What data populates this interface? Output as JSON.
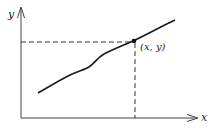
{
  "diagram": {
    "type": "function-graph",
    "axes": {
      "x_label": "x",
      "y_label": "y"
    },
    "point": {
      "label": "(x, y)"
    },
    "colors": {
      "stroke": "#1a1a1a",
      "guide": "#333333",
      "background": "#ffffff"
    }
  }
}
